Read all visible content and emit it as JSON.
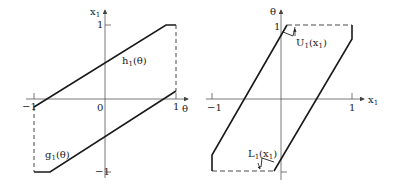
{
  "left_plot": {
    "y_axis_label": "x",
    "y_axis_sub": "1",
    "x_axis_label": "θ",
    "ticks": {
      "y_top": "1",
      "y_bottom": "−1",
      "x_left": "−1",
      "x_right": "1",
      "origin": "0"
    },
    "curves": [
      {
        "name": "h",
        "sub": "1",
        "arg": "(θ)"
      },
      {
        "name": "g",
        "sub": "1",
        "arg": "(θ)"
      }
    ]
  },
  "right_plot": {
    "y_axis_label": "θ",
    "x_axis_label": "x",
    "x_axis_sub": "1",
    "ticks": {
      "y_top": "1",
      "x_left": "−1",
      "x_right": "1"
    },
    "curves": [
      {
        "name": "U",
        "sub": "1",
        "arg": "(x",
        "arg_sub": "1",
        "arg_close": ")"
      },
      {
        "name": "L",
        "sub": "1",
        "arg": "(x",
        "arg_sub": "1",
        "arg_close": ")"
      }
    ]
  },
  "colors": {
    "line": "#1a1a1a",
    "axis": "#555555"
  }
}
